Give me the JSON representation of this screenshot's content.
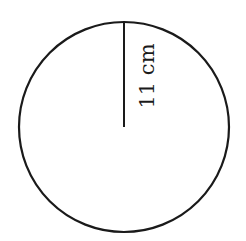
{
  "diagram": {
    "shape": "circle",
    "radius_label": "11 cm",
    "center": [
      124,
      127
    ],
    "radius_px": 105,
    "stroke_color": "#1a1a1a",
    "background": "#ffffff"
  }
}
